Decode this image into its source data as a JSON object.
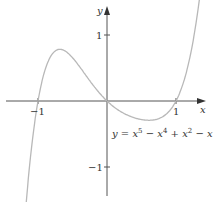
{
  "chart_data": {
    "type": "line",
    "title": "",
    "xlabel": "x",
    "ylabel": "y",
    "equation": "y = x^5 - x^4 + x^2 - x",
    "x_ticks": [
      "-1",
      "1"
    ],
    "y_ticks": [
      "1",
      "-1"
    ],
    "xlim": [
      -1.55,
      1.5
    ],
    "ylim": [
      -1.5,
      1.5
    ],
    "grid": false,
    "series": [
      {
        "name": "y = x^5 - x^4 + x^2 - x",
        "x": [
          -1.3,
          -1.2,
          -1.1,
          -1.0,
          -0.9,
          -0.8,
          -0.7,
          -0.6,
          -0.5,
          -0.4,
          -0.3,
          -0.2,
          -0.1,
          0.0,
          0.1,
          0.2,
          0.3,
          0.4,
          0.5,
          0.6,
          0.7,
          0.8,
          0.9,
          1.0,
          1.1,
          1.2,
          1.3
        ],
        "values": [
          -3.64,
          -1.84,
          -0.69,
          0.0,
          0.38,
          0.55,
          0.59,
          0.55,
          0.47,
          0.37,
          0.25,
          0.14,
          0.05,
          0.0,
          -0.09,
          -0.16,
          -0.22,
          -0.26,
          -0.28,
          -0.26,
          -0.21,
          -0.12,
          -0.02,
          0.0,
          0.28,
          0.74,
          1.42
        ]
      }
    ]
  },
  "labels": {
    "x_axis": "x",
    "y_axis": "y",
    "tick_x_neg1": "−1",
    "tick_x_1": "1",
    "tick_y_1": "1",
    "tick_y_neg1": "−1",
    "eq_y": "y",
    "eq_equals": " = ",
    "eq_x1": "x",
    "eq_p5": "5",
    "eq_minus1": " − ",
    "eq_x2": "x",
    "eq_p4": "4",
    "eq_plus": " + ",
    "eq_x3": "x",
    "eq_p2": "2",
    "eq_minus2": " − ",
    "eq_x4": "x"
  },
  "colors": {
    "axis": "#555555",
    "curve": "#b8b8b8",
    "text": "#333333"
  }
}
